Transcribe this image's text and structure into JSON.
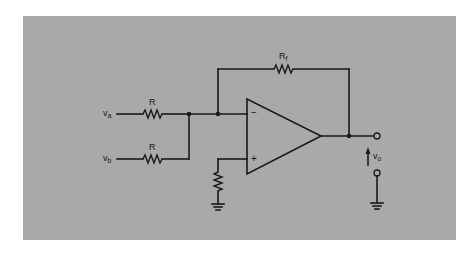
{
  "figure": {
    "type": "summing-amplifier-schematic",
    "background_color": "#a9a9a9",
    "line_color": "#1a1a1a"
  },
  "labels": {
    "input_a": {
      "main": "v",
      "sub": "a"
    },
    "input_b": {
      "main": "v",
      "sub": "b"
    },
    "resistor_a": {
      "main": "R",
      "sub": ""
    },
    "resistor_b": {
      "main": "R",
      "sub": ""
    },
    "feedback_resistor": {
      "main": "R",
      "sub": "f"
    },
    "output": {
      "main": "v",
      "sub": "o"
    }
  },
  "opamp": {
    "inverting_sign": "−",
    "noninverting_sign": "+"
  },
  "components": [
    {
      "id": "R_a",
      "type": "resistor",
      "label": "R",
      "between": [
        "v_a",
        "summing_node"
      ]
    },
    {
      "id": "R_b",
      "type": "resistor",
      "label": "R",
      "between": [
        "v_b",
        "summing_node"
      ]
    },
    {
      "id": "R_f",
      "type": "resistor",
      "label": "Rf",
      "between": [
        "inverting_input",
        "output"
      ]
    },
    {
      "id": "R_bias",
      "type": "resistor",
      "label": "",
      "between": [
        "noninverting_input",
        "ground"
      ]
    },
    {
      "id": "U1",
      "type": "op-amp",
      "inputs": [
        "−",
        "+"
      ]
    },
    {
      "id": "GND1",
      "type": "ground"
    },
    {
      "id": "GND2",
      "type": "ground"
    }
  ]
}
